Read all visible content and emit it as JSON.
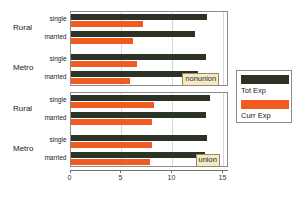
{
  "chart_data": {
    "type": "bar",
    "orientation": "horizontal",
    "title": "",
    "xlabel": "",
    "ylabel": "",
    "xlim": [
      0,
      15.5
    ],
    "xticks": [
      0,
      5,
      10,
      15
    ],
    "xticklabels": [
      "0",
      "5",
      "10",
      "15"
    ],
    "grid": true,
    "legend_position": "right",
    "legend": [
      {
        "name": "Tot Exp",
        "color": "#2b3326"
      },
      {
        "name": "Curr Exp",
        "color": "#ef5b20"
      }
    ],
    "series": [
      {
        "name": "Tot Exp",
        "color": "#2b3326"
      },
      {
        "name": "Curr Exp",
        "color": "#ef5b20"
      }
    ],
    "panels": [
      {
        "strip_label": "nonunion",
        "groups": [
          {
            "label": "Rural",
            "rows": [
              {
                "label": "single",
                "values": {
                  "Tot Exp": 13.4,
                  "Curr Exp": 7.1
                }
              },
              {
                "label": "married",
                "values": {
                  "Tot Exp": 12.2,
                  "Curr Exp": 6.1
                }
              }
            ]
          },
          {
            "label": "Metro",
            "rows": [
              {
                "label": "single",
                "values": {
                  "Tot Exp": 13.3,
                  "Curr Exp": 6.5
                }
              },
              {
                "label": "married",
                "values": {
                  "Tot Exp": 12.5,
                  "Curr Exp": 5.8
                }
              }
            ]
          }
        ]
      },
      {
        "strip_label": "union",
        "groups": [
          {
            "label": "Rural",
            "rows": [
              {
                "label": "single",
                "values": {
                  "Tot Exp": 13.7,
                  "Curr Exp": 8.2
                }
              },
              {
                "label": "married",
                "values": {
                  "Tot Exp": 13.3,
                  "Curr Exp": 8.0
                }
              }
            ]
          },
          {
            "label": "Metro",
            "rows": [
              {
                "label": "single",
                "values": {
                  "Tot Exp": 13.4,
                  "Curr Exp": 8.0
                }
              },
              {
                "label": "married",
                "values": {
                  "Tot Exp": 13.2,
                  "Curr Exp": 7.8
                }
              }
            ]
          }
        ]
      }
    ]
  }
}
